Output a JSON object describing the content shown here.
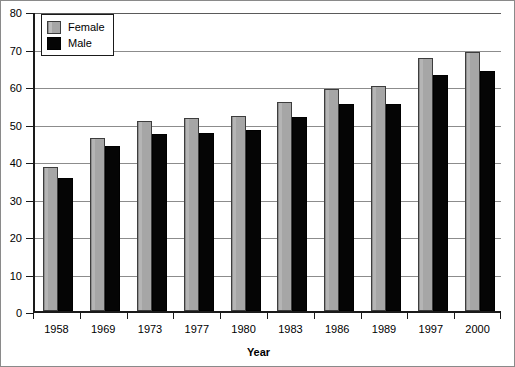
{
  "chart_data": {
    "type": "bar",
    "title": "",
    "xlabel": "Year",
    "ylabel": "",
    "categories": [
      "1958",
      "1969",
      "1973",
      "1977",
      "1980",
      "1983",
      "1986",
      "1989",
      "1997",
      "2000"
    ],
    "series": [
      {
        "name": "Female",
        "color": "#a6a6a6",
        "values": [
          38.4,
          46.1,
          50.8,
          51.6,
          51.9,
          55.7,
          59.3,
          60.0,
          67.6,
          69.2
        ]
      },
      {
        "name": "Male",
        "color": "#050505",
        "values": [
          35.5,
          44.1,
          47.3,
          47.6,
          48.3,
          51.7,
          55.2,
          55.3,
          63.0,
          64.0
        ]
      }
    ],
    "ylim": [
      0,
      80
    ],
    "ytick_values": [
      0,
      10,
      20,
      30,
      40,
      50,
      60,
      70,
      80
    ],
    "ytick_labels": [
      "0",
      "10",
      "20",
      "30",
      "40",
      "50",
      "60",
      "70",
      "80"
    ],
    "grid": true,
    "legend_position": "top-left",
    "legend_entries": [
      "Female",
      "Male"
    ]
  }
}
